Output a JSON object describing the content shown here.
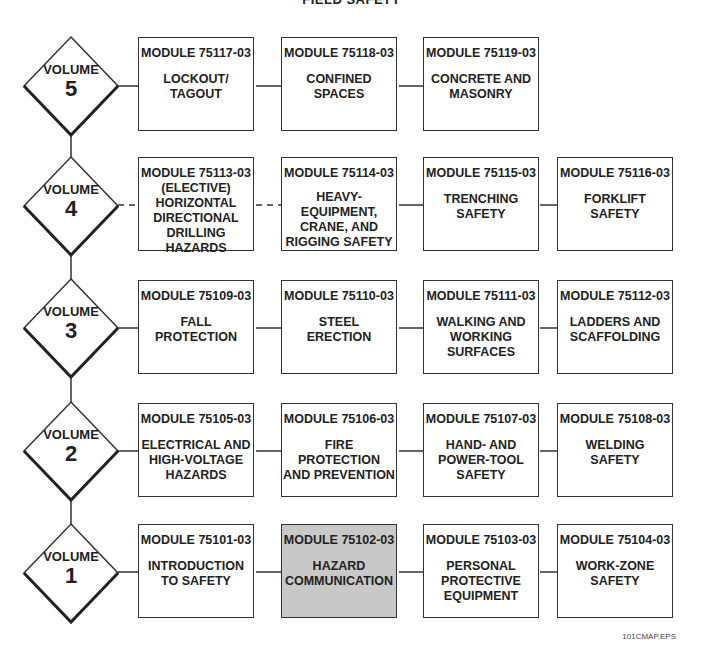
{
  "title": "FIELD SAFETY",
  "footer": "101CMAP.EPS",
  "highlight_color": "#c8c8c8",
  "volumes": [
    {
      "label": "VOLUME",
      "number": "5",
      "modules": [
        {
          "code": "MODULE 75117-03",
          "name": "LOCKOUT/\nTAGOUT"
        },
        {
          "code": "MODULE 75118-03",
          "name": "CONFINED\nSPACES"
        },
        {
          "code": "MODULE 75119-03",
          "name": "CONCRETE AND\nMASONRY"
        }
      ]
    },
    {
      "label": "VOLUME",
      "number": "4",
      "modules": [
        {
          "code": "MODULE 75113-03",
          "name": "(ELECTIVE)\nHORIZONTAL\nDIRECTIONAL\nDRILLING\nHAZARDS",
          "elective": true
        },
        {
          "code": "MODULE 75114-03",
          "name": "HEAVY-\nEQUIPMENT,\nCRANE, AND\nRIGGING SAFETY"
        },
        {
          "code": "MODULE 75115-03",
          "name": "TRENCHING\nSAFETY"
        },
        {
          "code": "MODULE 75116-03",
          "name": "FORKLIFT\nSAFETY"
        }
      ]
    },
    {
      "label": "VOLUME",
      "number": "3",
      "modules": [
        {
          "code": "MODULE 75109-03",
          "name": "FALL\nPROTECTION"
        },
        {
          "code": "MODULE 75110-03",
          "name": "STEEL\nERECTION"
        },
        {
          "code": "MODULE 75111-03",
          "name": "WALKING AND\nWORKING\nSURFACES"
        },
        {
          "code": "MODULE 75112-03",
          "name": "LADDERS AND\nSCAFFOLDING"
        }
      ]
    },
    {
      "label": "VOLUME",
      "number": "2",
      "modules": [
        {
          "code": "MODULE 75105-03",
          "name": "ELECTRICAL AND\nHIGH-VOLTAGE\nHAZARDS"
        },
        {
          "code": "MODULE 75106-03",
          "name": "FIRE\nPROTECTION\nAND PREVENTION"
        },
        {
          "code": "MODULE 75107-03",
          "name": "HAND- AND\nPOWER-TOOL\nSAFETY"
        },
        {
          "code": "MODULE 75108-03",
          "name": "WELDING\nSAFETY"
        }
      ]
    },
    {
      "label": "VOLUME",
      "number": "1",
      "modules": [
        {
          "code": "MODULE 75101-03",
          "name": "INTRODUCTION\nTO SAFETY"
        },
        {
          "code": "MODULE 75102-03",
          "name": "HAZARD\nCOMMUNICATION",
          "highlighted": true
        },
        {
          "code": "MODULE 75103-03",
          "name": "PERSONAL\nPROTECTIVE\nEQUIPMENT"
        },
        {
          "code": "MODULE 75104-03",
          "name": "WORK-ZONE\nSAFETY"
        }
      ]
    }
  ]
}
